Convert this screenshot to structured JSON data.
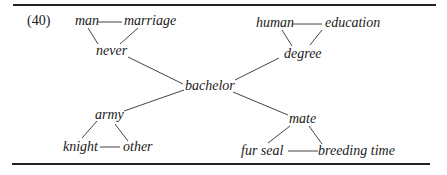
{
  "example_number": "(40)",
  "center": "bachelor",
  "nodes": {
    "man": "man",
    "marriage": "marriage",
    "never": "never",
    "bachelor": "bachelor",
    "human": "human",
    "education": "education",
    "degree": "degree",
    "army": "army",
    "knight": "knight",
    "other": "other",
    "mate": "mate",
    "fur_seal": "fur seal",
    "breeding_time": "breeding time"
  },
  "clusters": [
    {
      "hub": "never",
      "members": [
        "man",
        "marriage"
      ]
    },
    {
      "hub": "degree",
      "members": [
        "human",
        "education"
      ]
    },
    {
      "hub": "army",
      "members": [
        "knight",
        "other"
      ]
    },
    {
      "hub": "mate",
      "members": [
        "fur seal",
        "breeding time"
      ]
    }
  ],
  "edges": [
    [
      "man",
      "marriage"
    ],
    [
      "man",
      "never"
    ],
    [
      "marriage",
      "never"
    ],
    [
      "never",
      "bachelor"
    ],
    [
      "human",
      "education"
    ],
    [
      "human",
      "degree"
    ],
    [
      "education",
      "degree"
    ],
    [
      "degree",
      "bachelor"
    ],
    [
      "knight",
      "other"
    ],
    [
      "knight",
      "army"
    ],
    [
      "other",
      "army"
    ],
    [
      "army",
      "bachelor"
    ],
    [
      "fur seal",
      "breeding time"
    ],
    [
      "fur seal",
      "mate"
    ],
    [
      "breeding time",
      "mate"
    ],
    [
      "mate",
      "bachelor"
    ]
  ]
}
